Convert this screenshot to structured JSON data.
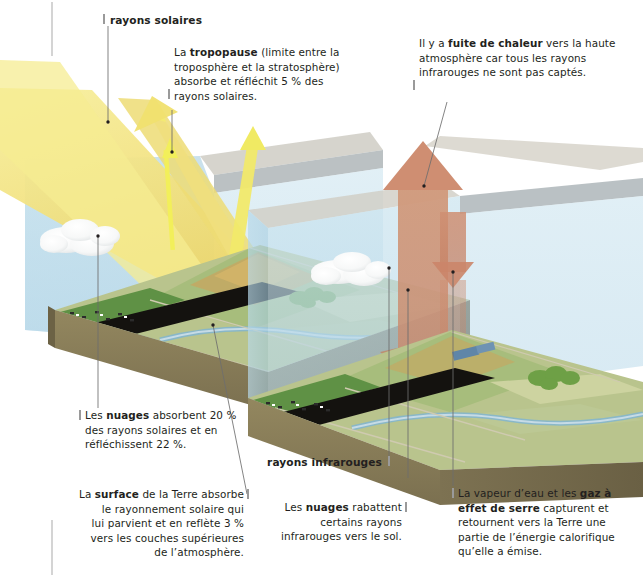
{
  "figure": {
    "language": "fr"
  },
  "labels": {
    "solar_rays": "rayons solaires",
    "infrared_rays": "rayons infrarouges"
  },
  "callouts": {
    "tropopause": {
      "lines": [
        "La tropopause (limite entre la",
        "troposphère et la stratosphère)",
        "absorbe et réfléchit 5 % des",
        "rayons solaires."
      ],
      "bold": "tropopause",
      "value": "5 %"
    },
    "heat_leak": {
      "lines": [
        "Il y a fuite de chaleur vers la haute",
        "atmosphère car tous les rayons",
        "infrarouges ne sont pas captés."
      ],
      "bold": "fuite de chaleur"
    },
    "clouds_absorb": {
      "lines": [
        "Les nuages absorbent 20 %",
        "des rayons solaires et en",
        "réfléchissent 22 %."
      ],
      "bold": "nuages",
      "values": [
        "20 %",
        "22 %"
      ]
    },
    "surface": {
      "lines": [
        "La surface de la Terre absorbe",
        "le rayonnement solaire qui",
        "lui parvient et en reflète 3 %",
        "vers les couches supérieures",
        "de l’atmosphère."
      ],
      "bold": "surface",
      "value": "3 %"
    },
    "clouds_reflect": {
      "lines": [
        "Les nuages rabattent",
        "certains rayons",
        "infrarouges vers le sol."
      ],
      "bold": "nuages"
    },
    "greenhouse_gas": {
      "lines": [
        "La vapeur d’eau et les gaz à",
        "effet de serre capturent et",
        "retournent vers la Terre une",
        "partie de l’énergie calorifique",
        "qu’elle a émise."
      ],
      "bold": "gaz à effet de serre"
    }
  },
  "colors": {
    "text": "#231f20",
    "leader": "#6e6e6e",
    "tick": "#9a9a9a",
    "sunbeam": "#f2e27e",
    "sunbeam_deep": "#e8c65a",
    "sunray_arrow": "#f2ef5a",
    "infrared_arrow": "#cf8e72",
    "infrared_arrow_dark": "#c07e62",
    "atmosphere": "#bfdcea",
    "atmosphere_side": "#a9cfe2",
    "tropopause_slab": "#b9bfc2",
    "tropopause_slab_top": "#d9d6cd",
    "soil": "#8a7f5e",
    "soil_dark": "#6f6547",
    "grass": "#9fb77d",
    "grass_dark": "#7d9a5c",
    "pasture": "#5f9145",
    "field": "#c9cf9b",
    "water": "#7fb4cc",
    "road": "#14120f",
    "cloud": "#ffffff",
    "tree": "#6ea046"
  },
  "scene": {
    "panels": [
      {
        "name": "solar-panel",
        "caption": "rayons solaires"
      },
      {
        "name": "infrared-panel",
        "caption": "rayons infrarouges"
      }
    ],
    "elements": [
      "sunbeam-incoming",
      "sunbeam-reflected-cloud",
      "sunbeam-reflected-surface",
      "cloud-left",
      "cloud-right",
      "tropopause-slab",
      "atmosphere-box",
      "infrared-up-arrow",
      "infrared-down-arrow",
      "ground-block",
      "road",
      "river",
      "cows",
      "trees",
      "train"
    ]
  }
}
